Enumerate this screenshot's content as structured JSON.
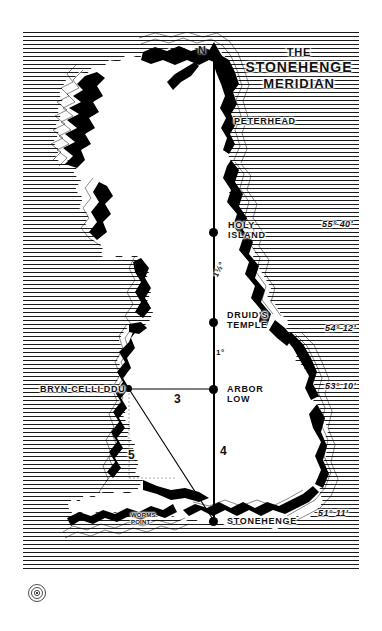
{
  "figure": {
    "name": "the-stonehenge-meridian-map",
    "region": "Great Britain"
  },
  "title": {
    "line1": "THE",
    "line2": "STONEHENGE",
    "line3": "MERIDIAN"
  },
  "compass": {
    "north_label": "N"
  },
  "places": [
    {
      "id": "peterhead",
      "label": "PETERHEAD",
      "lines": [
        "PETERHEAD"
      ],
      "on_meridian": false
    },
    {
      "id": "holy-island",
      "label": "HOLY ISLAND",
      "lines": [
        "HOLY",
        "ISLAND"
      ],
      "on_meridian": true
    },
    {
      "id": "druids-temple",
      "label": "DRUID'S TEMPLE",
      "lines": [
        "DRUID'S",
        "TEMPLE"
      ],
      "on_meridian": true
    },
    {
      "id": "arbor-low",
      "label": "ARBOR LOW",
      "lines": [
        "ARBOR",
        "LOW"
      ],
      "on_meridian": true
    },
    {
      "id": "stonehenge",
      "label": "STONEHENGE",
      "lines": [
        "STONEHENGE"
      ],
      "on_meridian": true
    },
    {
      "id": "bryn-celli-ddu",
      "label": "BRYN CELLI DDU",
      "lines": [
        "BRYN CELLI DDU"
      ],
      "on_meridian": false
    },
    {
      "id": "worms-point",
      "label": "WORMS POINT",
      "lines": [
        "WORMS",
        "POINT"
      ],
      "on_meridian": false
    }
  ],
  "latitudes": [
    {
      "id": "lat-holy-island",
      "value": "55° 40'"
    },
    {
      "id": "lat-druids-temple",
      "value": "54° 12'"
    },
    {
      "id": "lat-arbor-low",
      "value": "53° 10'"
    },
    {
      "id": "lat-stonehenge",
      "value": "51° 11'"
    }
  ],
  "meridian_spans": [
    {
      "id": "span-holy-to-druids",
      "value": "1½°"
    },
    {
      "id": "span-druids-to-arbor",
      "value": "1°"
    }
  ],
  "triangle": {
    "name": "3-4-5 pythagorean triangle",
    "sides": [
      {
        "id": "side-3",
        "label": "3",
        "from": "bryn-celli-ddu",
        "to": "arbor-low"
      },
      {
        "id": "side-4",
        "label": "4",
        "from": "arbor-low",
        "to": "stonehenge"
      },
      {
        "id": "side-5",
        "label": "5",
        "from": "bryn-celli-ddu",
        "to": "stonehenge"
      }
    ]
  },
  "colors": {
    "ink": "#111111",
    "paper": "#ffffff",
    "sea_hatch": "#1a1a1a"
  }
}
